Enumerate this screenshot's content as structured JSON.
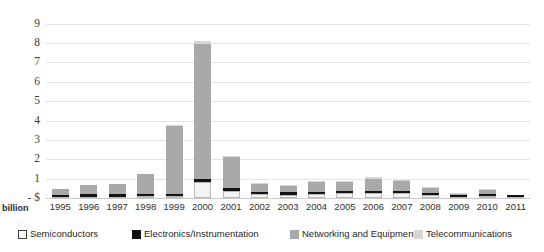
{
  "chart_data": {
    "type": "bar",
    "stacked": true,
    "title": "",
    "xlabel": "",
    "ylabel": "",
    "unit_label": "billion",
    "axis_origin_label": "- $",
    "ylim": [
      0,
      9.4
    ],
    "ytick_labels": [
      "9",
      "8",
      "7",
      "6",
      "5",
      "4",
      "3",
      "2",
      "1",
      "- $"
    ],
    "ytick_values": [
      9,
      8,
      7,
      6,
      5,
      4,
      3,
      2,
      1,
      0
    ],
    "grid": true,
    "legend_position": "bottom",
    "categories": [
      "1995",
      "1996",
      "1997",
      "1998",
      "1999",
      "2000",
      "2001",
      "2002",
      "2003",
      "2004",
      "2005",
      "2006",
      "2007",
      "2008",
      "2009",
      "2010",
      "2011"
    ],
    "series": [
      {
        "name": "Semiconductors",
        "color": "#ffffff",
        "values": [
          0.06,
          0.07,
          0.07,
          0.08,
          0.1,
          0.82,
          0.38,
          0.22,
          0.18,
          0.22,
          0.25,
          0.27,
          0.26,
          0.16,
          0.06,
          0.12,
          0.04
        ]
      },
      {
        "name": "Electronics/Instrumentation",
        "color": "#111111",
        "values": [
          0.05,
          0.06,
          0.06,
          0.06,
          0.08,
          0.16,
          0.09,
          0.07,
          0.07,
          0.09,
          0.09,
          0.09,
          0.1,
          0.05,
          0.03,
          0.04,
          0.03
        ]
      },
      {
        "name": "Networking and Equipment",
        "color": "#a9a9a9",
        "values": [
          0.34,
          0.52,
          0.6,
          1.1,
          3.55,
          6.98,
          1.65,
          0.45,
          0.35,
          0.53,
          0.48,
          0.61,
          0.52,
          0.32,
          0.11,
          0.25,
          0.06
        ]
      },
      {
        "name": "Telecommunications",
        "color": "#d6d6d6",
        "values": [
          0.0,
          0.0,
          0.0,
          0.0,
          0.02,
          0.14,
          0.03,
          0.02,
          0.02,
          0.04,
          0.05,
          0.1,
          0.05,
          0.02,
          0.01,
          0.02,
          0.0
        ]
      }
    ],
    "totals": [
      0.45,
      0.65,
      0.73,
      1.24,
      3.75,
      8.1,
      2.15,
      0.76,
      0.62,
      0.88,
      0.87,
      1.07,
      0.93,
      0.55,
      0.21,
      0.43,
      0.13
    ]
  },
  "legend": {
    "items": [
      {
        "label": "Semiconductors",
        "swatch": "semi"
      },
      {
        "label": "Electronics/Instrumentation",
        "swatch": "elec"
      },
      {
        "label": "Networking and Equipment",
        "swatch": "net"
      },
      {
        "label": "Telecommunications",
        "swatch": "tele"
      }
    ]
  },
  "colors": {
    "semiconductors": "#ffffff",
    "electronics": "#111111",
    "networking": "#a9a9a9",
    "telecommunications": "#d6d6d6",
    "gridline": "#e4e4e4",
    "text": "#2e2e2e"
  }
}
